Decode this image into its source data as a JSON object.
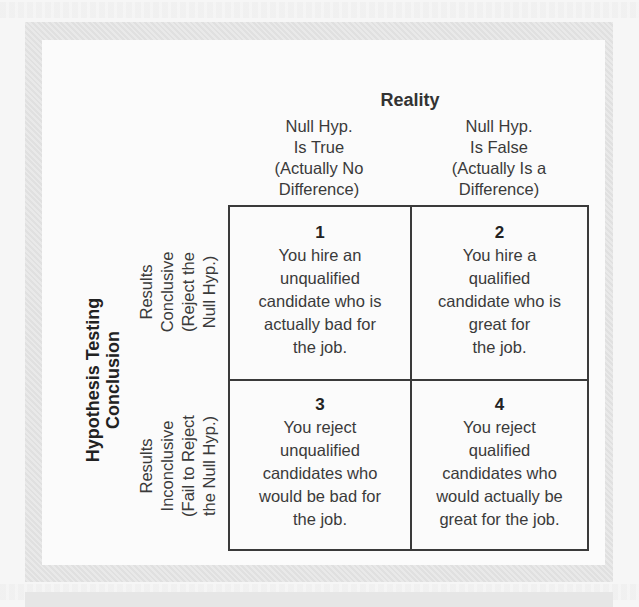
{
  "figure": {
    "column_axis_title": "Reality",
    "row_axis_title": [
      "Hypothesis Testing",
      "Conclusion"
    ],
    "columns": [
      {
        "lines": [
          "Null Hyp.",
          "Is True",
          "(Actually No",
          "Difference)"
        ]
      },
      {
        "lines": [
          "Null Hyp.",
          "Is False",
          "(Actually Is a",
          "Difference)"
        ]
      }
    ],
    "rows": [
      {
        "lines": [
          "Results",
          "Conclusive",
          "(Reject the",
          "Null Hyp.)"
        ]
      },
      {
        "lines": [
          "Results",
          "Inconclusive",
          "(Fail to Reject",
          "the Null Hyp.)"
        ]
      }
    ],
    "cells": [
      {
        "number": "1",
        "lines": [
          "You hire an",
          "unqualified",
          "candidate who is",
          "actually bad for",
          "the job."
        ]
      },
      {
        "number": "2",
        "lines": [
          "You hire a",
          "qualified",
          "candidate who is",
          "great for",
          "the job."
        ]
      },
      {
        "number": "3",
        "lines": [
          "You reject",
          "unqualified",
          "candidates who",
          "would be bad for",
          "the job."
        ]
      },
      {
        "number": "4",
        "lines": [
          "You reject",
          "qualified",
          "candidates who",
          "would actually be",
          "great for the job."
        ]
      }
    ]
  }
}
